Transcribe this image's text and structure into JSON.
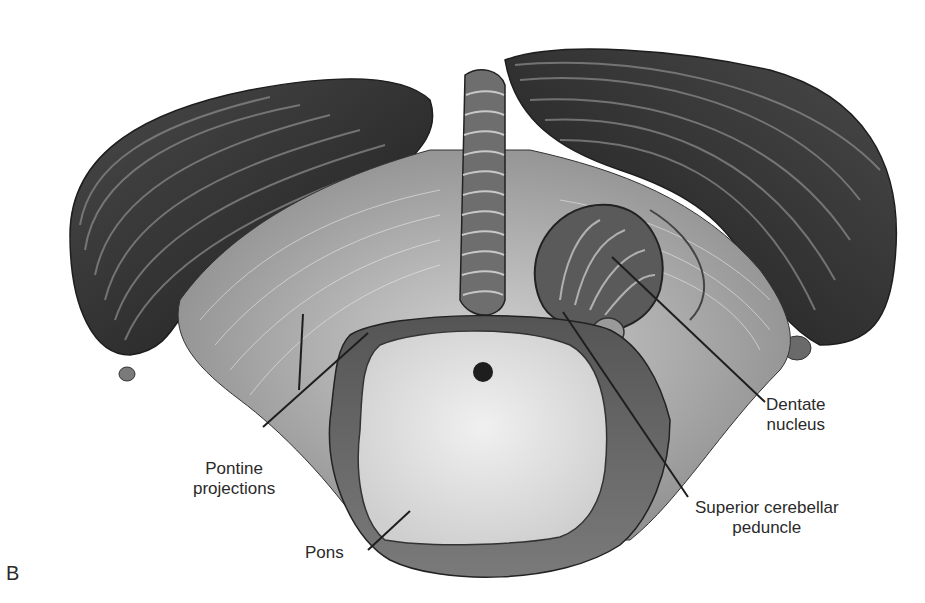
{
  "figure": {
    "panel_letter": "B",
    "colors": {
      "background": "#ffffff",
      "hemisphere_dark": "#3a3a3a",
      "hemisphere_mid": "#6a6a6a",
      "white_matter": "#b9b9b9",
      "pons_section": "#e4e4e4",
      "leader_line": "#1e1e1e",
      "text": "#2a2a2a"
    }
  },
  "labels": {
    "pontine": {
      "line1": "Pontine",
      "line2": "projections"
    },
    "pons": {
      "text": "Pons"
    },
    "dentate": {
      "line1": "Dentate",
      "line2": "nucleus"
    },
    "scp": {
      "line1": "Superior cerebellar",
      "line2": "peduncle"
    }
  }
}
